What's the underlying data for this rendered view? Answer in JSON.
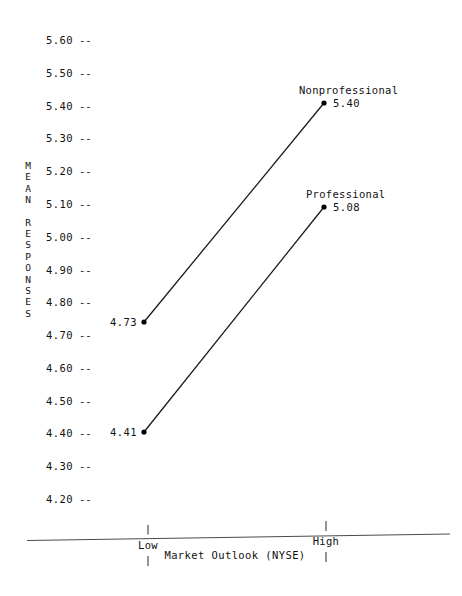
{
  "chart_data": {
    "type": "line",
    "title": "",
    "xlabel": "Market Outlook (NYSE)",
    "ylabel": "MEAN RESPONSES",
    "categories": [
      "Low",
      "High"
    ],
    "series": [
      {
        "name": "Nonprofessional",
        "values": [
          4.73,
          5.4
        ]
      },
      {
        "name": "Professional",
        "values": [
          4.41,
          5.08
        ]
      }
    ],
    "ylim": [
      4.15,
      5.65
    ],
    "y_ticks": [
      5.6,
      5.5,
      5.4,
      5.3,
      5.2,
      5.1,
      5.0,
      4.9,
      4.8,
      4.7,
      4.6,
      4.5,
      4.4,
      4.3,
      4.2
    ],
    "y_tick_labels": [
      "5.60",
      "5.50",
      "5.40",
      "5.30",
      "5.20",
      "5.10",
      "5.00",
      "4.90",
      "4.80",
      "4.70",
      "4.60",
      "4.50",
      "4.40",
      "4.30",
      "4.20"
    ],
    "y_tick_mark": "--",
    "grid": false,
    "legend": "inline-endpoint-labels",
    "marker": "filled-circle",
    "line_color": "#000000",
    "text_color": "#111111",
    "background_color": "#ffffff"
  },
  "y_axis": {
    "title_words": [
      "MEAN",
      "RESPONSES"
    ],
    "title_chars": [
      [
        "M",
        "E",
        "A",
        "N"
      ],
      [
        "R",
        "E",
        "S",
        "P",
        "O",
        "N",
        "S",
        "E",
        "S"
      ]
    ]
  },
  "x_axis": {
    "title": "Market Outlook (NYSE)",
    "ticks": [
      {
        "label": "Low",
        "x": 148
      },
      {
        "label": "High",
        "x": 326
      }
    ]
  },
  "points": [
    {
      "series": "Nonprofessional",
      "category": "High",
      "value_label": "5.40",
      "name_label": "Nonprofessional",
      "x": 324,
      "y": 103
    },
    {
      "series": "Nonprofessional",
      "category": "Low",
      "value_label": "4.73",
      "name_label": "",
      "x": 144,
      "y": 322
    },
    {
      "series": "Professional",
      "category": "High",
      "value_label": "5.08",
      "name_label": "Professional",
      "x": 324,
      "y": 207
    },
    {
      "series": "Professional",
      "category": "Low",
      "value_label": "4.41",
      "name_label": "",
      "x": 144,
      "y": 432
    }
  ],
  "labels": {
    "nonprofessional_name": "Nonprofessional",
    "nonprofessional_high_value": "5.40",
    "nonprofessional_low_value": "4.73",
    "professional_name": "Professional",
    "professional_high_value": "5.08",
    "professional_low_value": "4.41",
    "tick_low": "Low",
    "tick_high": "High",
    "x_title": "Market Outlook (NYSE)"
  }
}
